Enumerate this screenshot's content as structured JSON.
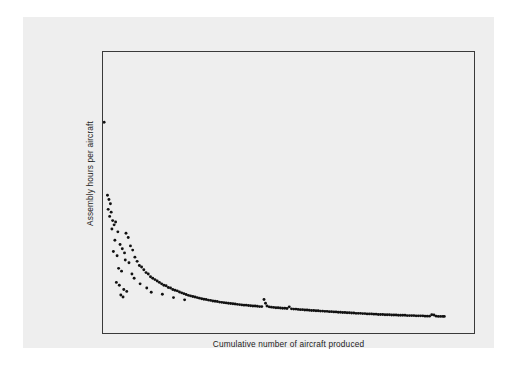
{
  "figure": {
    "background_color": "#eeeeee",
    "page_color": "#ffffff",
    "frame_color": "#3a3a3a",
    "marker_color": "#111111"
  },
  "axes": {
    "y_title": "Assembly hours per aircraft",
    "x_title": "Cumulative number of aircraft produced"
  },
  "chart_data": {
    "type": "scatter",
    "title": "",
    "subtitle": "",
    "xlabel": "Cumulative number of aircraft produced",
    "ylabel": "Assembly hours per aircraft",
    "xlim": [
      0,
      100
    ],
    "ylim": [
      0,
      100
    ],
    "grid": false,
    "legend": null,
    "tick_labels": {
      "x": [],
      "y": []
    },
    "annotations": [],
    "series": [
      {
        "name": "Assembly hours per aircraft",
        "marker": "dot",
        "color": "#111111",
        "points": [
          [
            0.3,
            75.0
          ],
          [
            1.2,
            49.0
          ],
          [
            1.6,
            47.5
          ],
          [
            2.0,
            46.0
          ],
          [
            1.4,
            44.0
          ],
          [
            2.2,
            43.0
          ],
          [
            1.8,
            41.5
          ],
          [
            2.6,
            40.0
          ],
          [
            3.0,
            38.5
          ],
          [
            2.4,
            37.0
          ],
          [
            3.4,
            39.5
          ],
          [
            4.0,
            36.0
          ],
          [
            6.2,
            35.5
          ],
          [
            3.2,
            33.0
          ],
          [
            4.6,
            31.5
          ],
          [
            5.2,
            30.0
          ],
          [
            6.8,
            34.0
          ],
          [
            2.8,
            29.0
          ],
          [
            3.8,
            27.5
          ],
          [
            5.8,
            28.5
          ],
          [
            7.4,
            31.0
          ],
          [
            8.0,
            29.5
          ],
          [
            6.0,
            26.0
          ],
          [
            7.0,
            25.0
          ],
          [
            8.6,
            27.0
          ],
          [
            9.2,
            25.5
          ],
          [
            4.2,
            23.0
          ],
          [
            5.0,
            22.0
          ],
          [
            9.8,
            24.0
          ],
          [
            10.4,
            23.5
          ],
          [
            7.8,
            21.0
          ],
          [
            11.0,
            22.5
          ],
          [
            11.6,
            21.5
          ],
          [
            8.4,
            19.5
          ],
          [
            12.2,
            21.0
          ],
          [
            12.8,
            20.0
          ],
          [
            3.6,
            18.0
          ],
          [
            4.4,
            17.0
          ],
          [
            13.4,
            19.5
          ],
          [
            14.0,
            19.0
          ],
          [
            10.0,
            17.5
          ],
          [
            14.6,
            18.5
          ],
          [
            15.2,
            18.0
          ],
          [
            5.6,
            15.5
          ],
          [
            6.4,
            14.8
          ],
          [
            15.8,
            17.5
          ],
          [
            16.4,
            17.0
          ],
          [
            11.8,
            16.0
          ],
          [
            17.0,
            16.8
          ],
          [
            17.6,
            16.2
          ],
          [
            4.8,
            13.5
          ],
          [
            5.4,
            12.8
          ],
          [
            18.2,
            16.0
          ],
          [
            18.8,
            15.5
          ],
          [
            13.0,
            14.5
          ],
          [
            19.4,
            15.2
          ],
          [
            20.0,
            15.0
          ],
          [
            20.6,
            14.6
          ],
          [
            21.2,
            14.3
          ],
          [
            16.0,
            13.8
          ],
          [
            21.8,
            14.0
          ],
          [
            22.4,
            13.7
          ],
          [
            23.0,
            13.4
          ],
          [
            23.6,
            13.2
          ],
          [
            24.2,
            13.0
          ],
          [
            19.0,
            12.6
          ],
          [
            24.8,
            12.8
          ],
          [
            25.4,
            12.6
          ],
          [
            26.0,
            12.4
          ],
          [
            26.6,
            12.2
          ],
          [
            27.2,
            12.0
          ],
          [
            22.0,
            11.8
          ],
          [
            27.8,
            11.9
          ],
          [
            28.4,
            11.7
          ],
          [
            29.0,
            11.6
          ],
          [
            29.6,
            11.4
          ],
          [
            30.2,
            11.3
          ],
          [
            30.8,
            11.2
          ],
          [
            31.4,
            11.0
          ],
          [
            32.0,
            10.9
          ],
          [
            32.6,
            10.8
          ],
          [
            33.2,
            10.7
          ],
          [
            33.8,
            10.6
          ],
          [
            34.4,
            10.5
          ],
          [
            35.0,
            10.4
          ],
          [
            35.6,
            10.3
          ],
          [
            36.2,
            10.2
          ],
          [
            36.8,
            10.1
          ],
          [
            37.4,
            10.0
          ],
          [
            38.0,
            9.9
          ],
          [
            38.6,
            9.9
          ],
          [
            39.2,
            9.8
          ],
          [
            39.8,
            9.7
          ],
          [
            40.4,
            9.6
          ],
          [
            41.0,
            9.6
          ],
          [
            41.6,
            9.5
          ],
          [
            42.2,
            9.4
          ],
          [
            42.8,
            9.4
          ],
          [
            43.4,
            11.9
          ],
          [
            43.8,
            10.6
          ],
          [
            44.2,
            9.6
          ],
          [
            44.8,
            9.3
          ],
          [
            45.4,
            9.2
          ],
          [
            46.0,
            9.1
          ],
          [
            46.6,
            9.0
          ],
          [
            47.2,
            9.0
          ],
          [
            47.8,
            8.9
          ],
          [
            48.4,
            8.8
          ],
          [
            49.0,
            8.8
          ],
          [
            49.6,
            8.7
          ],
          [
            50.2,
            9.3
          ],
          [
            50.8,
            8.6
          ],
          [
            51.4,
            8.5
          ],
          [
            52.0,
            8.5
          ],
          [
            52.6,
            8.4
          ],
          [
            53.2,
            8.3
          ],
          [
            53.8,
            8.3
          ],
          [
            54.4,
            8.2
          ],
          [
            55.0,
            8.2
          ],
          [
            55.6,
            8.1
          ],
          [
            56.2,
            8.0
          ],
          [
            56.8,
            8.0
          ],
          [
            57.4,
            7.9
          ],
          [
            58.0,
            7.9
          ],
          [
            58.6,
            7.8
          ],
          [
            59.2,
            7.8
          ],
          [
            59.8,
            7.7
          ],
          [
            60.4,
            7.7
          ],
          [
            61.0,
            7.6
          ],
          [
            61.6,
            7.6
          ],
          [
            62.2,
            7.5
          ],
          [
            62.8,
            7.5
          ],
          [
            63.4,
            7.4
          ],
          [
            64.0,
            7.4
          ],
          [
            64.6,
            7.3
          ],
          [
            65.2,
            7.3
          ],
          [
            65.8,
            7.2
          ],
          [
            66.4,
            7.2
          ],
          [
            67.0,
            7.1
          ],
          [
            67.6,
            7.1
          ],
          [
            68.2,
            7.0
          ],
          [
            68.8,
            7.0
          ],
          [
            69.4,
            7.0
          ],
          [
            70.0,
            6.9
          ],
          [
            70.6,
            6.9
          ],
          [
            71.2,
            6.8
          ],
          [
            71.8,
            6.8
          ],
          [
            72.4,
            6.8
          ],
          [
            73.0,
            6.7
          ],
          [
            73.6,
            6.7
          ],
          [
            74.2,
            6.6
          ],
          [
            74.8,
            6.6
          ],
          [
            75.4,
            6.6
          ],
          [
            76.0,
            6.5
          ],
          [
            76.6,
            6.5
          ],
          [
            77.2,
            6.5
          ],
          [
            77.8,
            6.4
          ],
          [
            78.4,
            6.4
          ],
          [
            79.0,
            6.4
          ],
          [
            79.6,
            6.3
          ],
          [
            80.2,
            6.3
          ],
          [
            80.8,
            6.3
          ],
          [
            81.4,
            6.3
          ],
          [
            82.0,
            6.2
          ],
          [
            82.6,
            6.2
          ],
          [
            83.2,
            6.2
          ],
          [
            83.8,
            6.2
          ],
          [
            84.4,
            6.1
          ],
          [
            85.0,
            6.1
          ],
          [
            85.6,
            6.1
          ],
          [
            86.2,
            6.1
          ],
          [
            86.8,
            6.0
          ],
          [
            87.4,
            6.0
          ],
          [
            88.0,
            6.0
          ],
          [
            88.6,
            6.5
          ],
          [
            89.2,
            6.4
          ],
          [
            89.8,
            6.0
          ],
          [
            90.4,
            5.9
          ],
          [
            91.0,
            5.9
          ],
          [
            91.6,
            5.9
          ],
          [
            92.0,
            5.9
          ]
        ]
      }
    ]
  }
}
